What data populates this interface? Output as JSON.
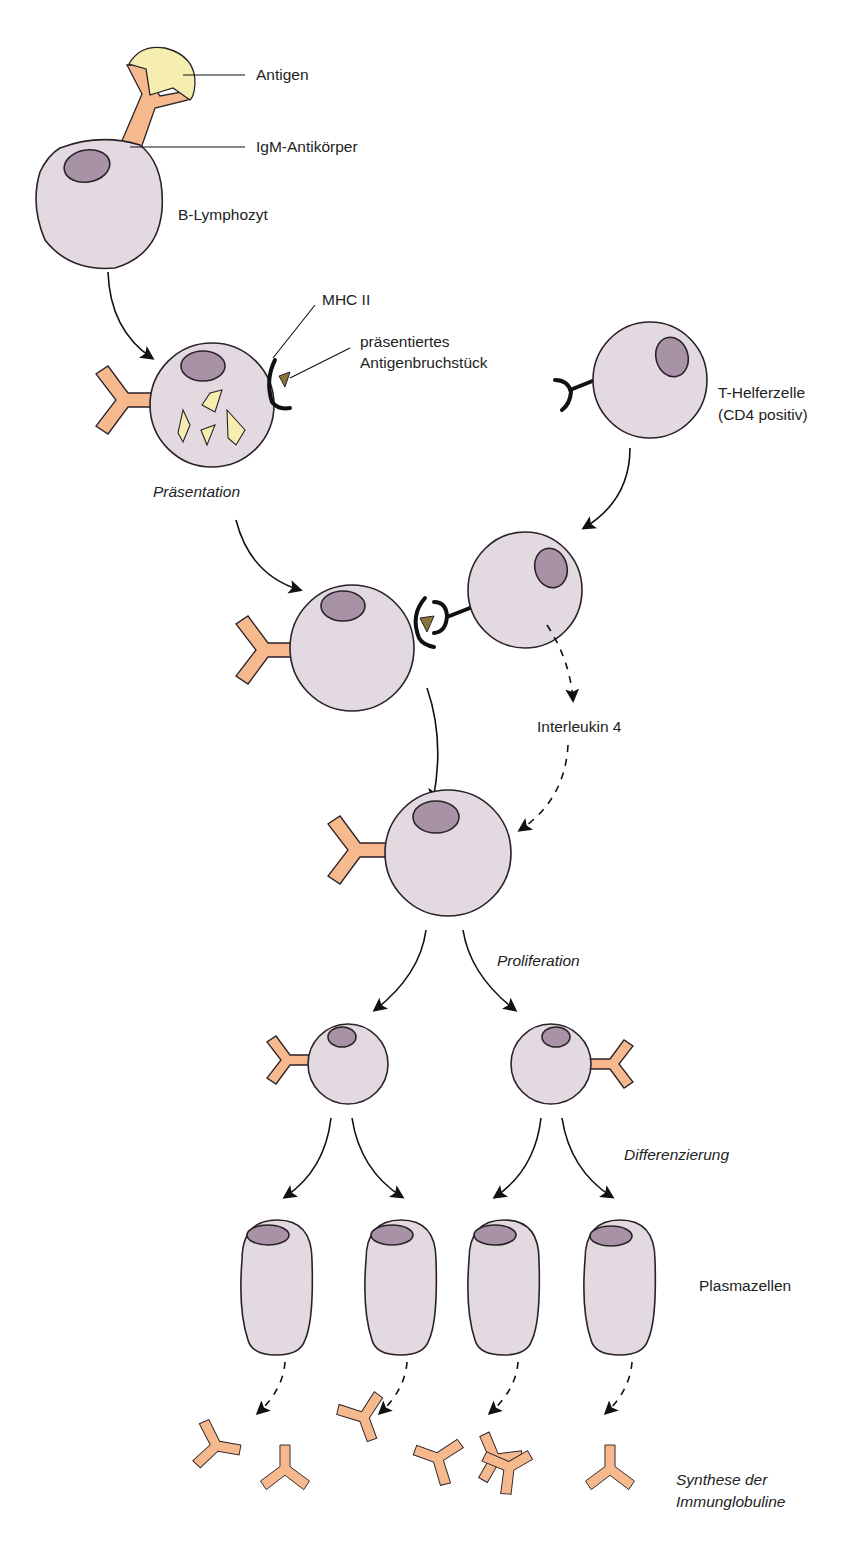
{
  "figure": {
    "colors": {
      "cell": "#e2dae0",
      "nucleus": "#a892a6",
      "antibody": "#f6b98e",
      "antigen": "#f6eeb0",
      "peptide": "#8a7238",
      "outline": "#2a2228"
    }
  },
  "labels": {
    "antigen": "Antigen",
    "igm_antibody": "IgM-Antikörper",
    "b_lymphocyte": "B-Lymphozyt",
    "mhc_ii": "MHC II",
    "presented_fragment_line1": "präsentiertes",
    "presented_fragment_line2": "Antigenbruchstück",
    "t_helper_line1": "T-Helferzelle",
    "t_helper_line2": "(CD4 positiv)",
    "interleukin": "Interleukin 4",
    "plasma_cells": "Plasmazellen"
  },
  "stages": {
    "presentation": "Präsentation",
    "proliferation": "Proliferation",
    "differentiation": "Differenzierung",
    "synthesis_line1": "Synthese der",
    "synthesis_line2": "Immunglobuline"
  },
  "nodes": [
    {
      "id": "b-cell-naive",
      "type": "b-lymphocyte",
      "label": "B-Lymphozyt",
      "bound": "Antigen + IgM-Antikörper"
    },
    {
      "id": "b-cell-presenting",
      "type": "b-lymphocyte",
      "label": "Präsentation",
      "features": [
        "MHC II",
        "präsentiertes Antigenbruchstück"
      ]
    },
    {
      "id": "t-helper",
      "type": "t-helper-cell",
      "label": "T-Helferzelle (CD4 positiv)"
    },
    {
      "id": "b-t-contact",
      "type": "cell-pair",
      "label": "B-Zelle / T-Helferzelle Kontakt"
    },
    {
      "id": "b-cell-activated",
      "type": "b-lymphocyte",
      "label": "aktivierte B-Zelle"
    },
    {
      "id": "b-daughter-1",
      "type": "b-lymphocyte",
      "label": "Proliferation"
    },
    {
      "id": "b-daughter-2",
      "type": "b-lymphocyte",
      "label": "Proliferation"
    },
    {
      "id": "plasma-1",
      "type": "plasma-cell",
      "label": "Plasmazellen"
    },
    {
      "id": "plasma-2",
      "type": "plasma-cell",
      "label": "Plasmazellen"
    },
    {
      "id": "plasma-3",
      "type": "plasma-cell",
      "label": "Plasmazellen"
    },
    {
      "id": "plasma-4",
      "type": "plasma-cell",
      "label": "Plasmazellen"
    },
    {
      "id": "immunoglobulins",
      "type": "antibodies",
      "count": 10,
      "label": "Synthese der Immunglobuline"
    }
  ],
  "edges": [
    {
      "from": "b-cell-naive",
      "to": "b-cell-presenting",
      "style": "solid"
    },
    {
      "from": "b-cell-presenting",
      "to": "b-t-contact",
      "style": "solid"
    },
    {
      "from": "t-helper",
      "to": "b-t-contact",
      "style": "solid"
    },
    {
      "from": "b-t-contact",
      "to": "b-cell-activated",
      "style": "solid"
    },
    {
      "from": "b-t-contact",
      "to": "b-cell-activated",
      "style": "dashed",
      "label": "Interleukin 4"
    },
    {
      "from": "b-cell-activated",
      "to": "b-daughter-1",
      "style": "solid"
    },
    {
      "from": "b-cell-activated",
      "to": "b-daughter-2",
      "style": "solid"
    },
    {
      "from": "b-daughter-1",
      "to": "plasma-1",
      "style": "solid"
    },
    {
      "from": "b-daughter-1",
      "to": "plasma-2",
      "style": "solid"
    },
    {
      "from": "b-daughter-2",
      "to": "plasma-3",
      "style": "solid"
    },
    {
      "from": "b-daughter-2",
      "to": "plasma-4",
      "style": "solid"
    },
    {
      "from": "plasma-1",
      "to": "immunoglobulins",
      "style": "dashed"
    },
    {
      "from": "plasma-2",
      "to": "immunoglobulins",
      "style": "dashed"
    },
    {
      "from": "plasma-3",
      "to": "immunoglobulins",
      "style": "dashed"
    },
    {
      "from": "plasma-4",
      "to": "immunoglobulins",
      "style": "dashed"
    }
  ]
}
